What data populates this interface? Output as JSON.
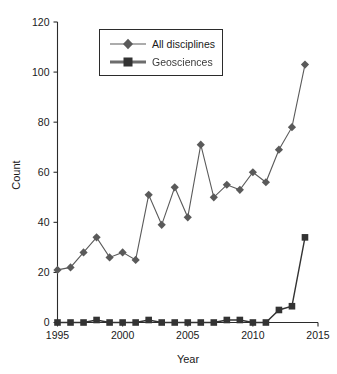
{
  "chart_data": {
    "type": "line",
    "title": "",
    "xlabel": "Year",
    "ylabel": "Count",
    "xlim": [
      1995,
      2015
    ],
    "ylim": [
      0,
      120
    ],
    "xticks": [
      1995,
      2000,
      2005,
      2010,
      2015
    ],
    "yticks": [
      0,
      20,
      40,
      60,
      80,
      100,
      120
    ],
    "grid": false,
    "legend_position": "top-center",
    "x": [
      1995,
      1996,
      1997,
      1998,
      1999,
      2000,
      2001,
      2002,
      2003,
      2004,
      2005,
      2006,
      2007,
      2008,
      2009,
      2010,
      2011,
      2012,
      2013,
      2014
    ],
    "series": [
      {
        "name": "All disciplines",
        "marker": "diamond",
        "color": "#5a5a5a",
        "values": [
          21,
          22,
          28,
          34,
          26,
          28,
          25,
          51,
          39,
          54,
          42,
          71,
          50,
          55,
          53,
          60,
          56,
          69,
          78,
          103
        ]
      },
      {
        "name": "Geosciences",
        "marker": "square",
        "color": "#333333",
        "values": [
          0,
          0,
          0,
          1,
          0,
          0,
          0,
          1,
          0,
          0,
          0,
          0,
          0,
          1,
          1,
          0,
          0,
          5,
          6.5,
          34
        ]
      }
    ]
  },
  "legend": {
    "entries": [
      {
        "label": "All disciplines"
      },
      {
        "label": "Geosciences"
      }
    ]
  },
  "axes": {
    "y_title": "Count",
    "x_title": "Year",
    "y_tick_labels": [
      "0",
      "20",
      "40",
      "60",
      "80",
      "100",
      "120"
    ],
    "x_tick_labels": [
      "1995",
      "2000",
      "2005",
      "2010",
      "2015"
    ]
  },
  "colors": {
    "series_all": "#5a5a5a",
    "series_geo": "#333333",
    "axis": "#2b2b2b",
    "background": "#ffffff"
  }
}
